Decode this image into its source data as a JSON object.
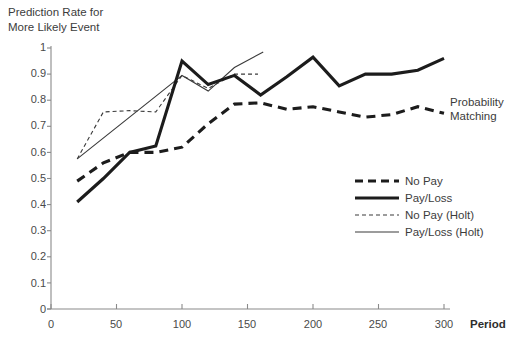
{
  "chart_data": {
    "type": "line",
    "title": "",
    "ylabel": "Prediction Rate for\nMore Likely Event",
    "xlabel": "Period",
    "xlim": [
      0,
      310
    ],
    "ylim": [
      0,
      1
    ],
    "xticks": [
      0,
      50,
      100,
      150,
      200,
      250,
      300
    ],
    "ytick_labels": [
      "0",
      "0.1",
      "0.2",
      "0.3",
      "0.4",
      "0.5",
      "0.6",
      "0.7",
      "0.8",
      "0.9",
      "1"
    ],
    "yticks": [
      0,
      0.1,
      0.2,
      0.3,
      0.4,
      0.5,
      0.6,
      0.7,
      0.8,
      0.9,
      1
    ],
    "grid": false,
    "legend_position": "center-right",
    "annotations": [
      {
        "text": "Probability\nMatching",
        "value": 0.75,
        "x_start": 370,
        "x_end": 445,
        "label_x": 452,
        "label_y": 0.79
      }
    ],
    "series": [
      {
        "name": "No Pay",
        "style": "dashed",
        "width": 3.1,
        "color": "#1c1c1c",
        "x": [
          20,
          40,
          60,
          80,
          100,
          120,
          140,
          160,
          180,
          200,
          220,
          240,
          260,
          280,
          300
        ],
        "y": [
          0.49,
          0.56,
          0.6,
          0.6,
          0.62,
          0.71,
          0.785,
          0.79,
          0.765,
          0.775,
          0.755,
          0.735,
          0.745,
          0.775,
          0.75
        ]
      },
      {
        "name": "Pay/Loss",
        "style": "solid",
        "width": 3.1,
        "color": "#1c1c1c",
        "x": [
          20,
          40,
          60,
          80,
          100,
          120,
          140,
          160,
          180,
          200,
          220,
          240,
          260,
          280,
          300
        ],
        "y": [
          0.41,
          0.5,
          0.6,
          0.625,
          0.95,
          0.86,
          0.895,
          0.82,
          0.89,
          0.965,
          0.855,
          0.9,
          0.9,
          0.915,
          0.96
        ]
      },
      {
        "name": "No Pay (Holt)",
        "style": "dashed",
        "width": 1.1,
        "color": "#3a3a3a",
        "x": [
          20,
          40,
          60,
          80,
          100,
          120,
          140,
          158
        ],
        "y": [
          0.575,
          0.755,
          0.76,
          0.755,
          0.895,
          0.845,
          0.9,
          0.9
        ]
      },
      {
        "name": "Pay/Loss (Holt)",
        "style": "solid",
        "width": 1.1,
        "color": "#3a3a3a",
        "x": [
          20,
          100,
          120,
          140,
          162
        ],
        "y": [
          0.575,
          0.895,
          0.835,
          0.925,
          0.985
        ]
      }
    ]
  },
  "ylabel_block": "Prediction Rate for\nMore Likely Event",
  "xlabel_block": "Period",
  "annotation_block": "Probability\nMatching",
  "ytick_labels": [
    "1",
    "0.9",
    "0.8",
    "0.7",
    "0.6",
    "0.5",
    "0.4",
    "0.3",
    "0.2",
    "0.1",
    "0"
  ],
  "xtick_labels": [
    "0",
    "50",
    "100",
    "150",
    "200",
    "250",
    "300"
  ],
  "legend": {
    "items": [
      {
        "label": "No Pay",
        "style": "thick-dashed"
      },
      {
        "label": "Pay/Loss",
        "style": "thick-solid"
      },
      {
        "label": "No Pay (Holt)",
        "style": "thin-dashed"
      },
      {
        "label": "Pay/Loss (Holt)",
        "style": "thin-solid"
      }
    ]
  },
  "colors": {
    "line": "#1c1c1c",
    "thin_line": "#3a3a3a",
    "axis": "#8a8a8a",
    "text": "#3c3c3c"
  }
}
